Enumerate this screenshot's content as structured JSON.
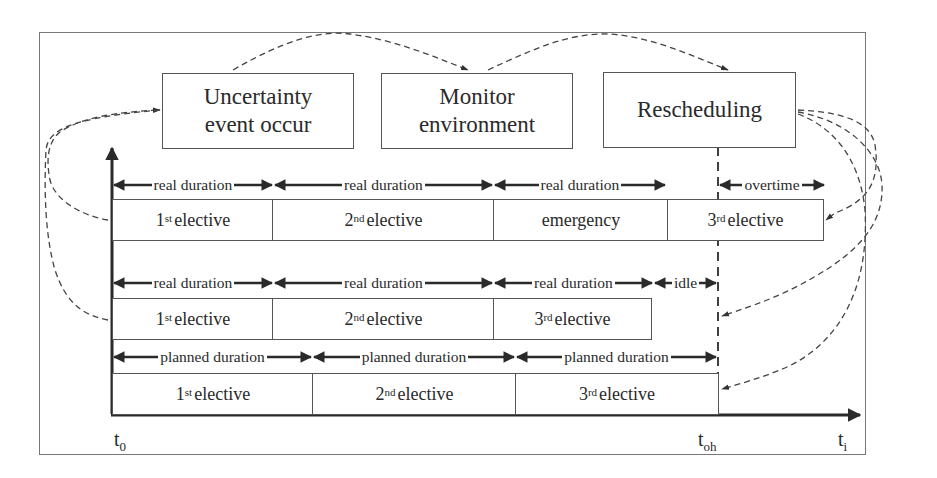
{
  "process_boxes": [
    {
      "id": "uncertainty",
      "line1": "Uncertainty",
      "line2": "event occur"
    },
    {
      "id": "monitor",
      "line1": "Monitor",
      "line2": "environment"
    },
    {
      "id": "rescheduling",
      "line1": "Rescheduling",
      "line2": ""
    }
  ],
  "rows": {
    "top": {
      "durations": [
        "real duration",
        "real duration",
        "real duration",
        "overtime"
      ],
      "cells": [
        {
          "num": "1",
          "sup": "st",
          "text": "elective"
        },
        {
          "num": "2",
          "sup": "nd",
          "text": "elective"
        },
        {
          "num": "",
          "sup": "",
          "text": "emergency"
        },
        {
          "num": "3",
          "sup": "rd",
          "text": "elective"
        }
      ]
    },
    "middle": {
      "durations": [
        "real duration",
        "real duration",
        "real duration",
        "idle"
      ],
      "cells": [
        {
          "num": "1",
          "sup": "st",
          "text": "elective"
        },
        {
          "num": "2",
          "sup": "nd",
          "text": "elective"
        },
        {
          "num": "3",
          "sup": "rd",
          "text": "elective"
        }
      ]
    },
    "bottom": {
      "durations": [
        "planned duration",
        "planned duration",
        "planned duration"
      ],
      "cells": [
        {
          "num": "1",
          "sup": "st",
          "text": "elective"
        },
        {
          "num": "2",
          "sup": "nd",
          "text": "elective"
        },
        {
          "num": "3",
          "sup": "rd",
          "text": "elective"
        }
      ]
    }
  },
  "axis_labels": {
    "t0": {
      "base": "t",
      "sub": "0"
    },
    "toh": {
      "base": "t",
      "sub": "oh"
    },
    "ti": {
      "base": "t",
      "sub": "i"
    }
  },
  "colors": {
    "line": "#2a2a2a",
    "dashed": "#444444",
    "frame": "#6a6a6a",
    "background": "#ffffff"
  }
}
